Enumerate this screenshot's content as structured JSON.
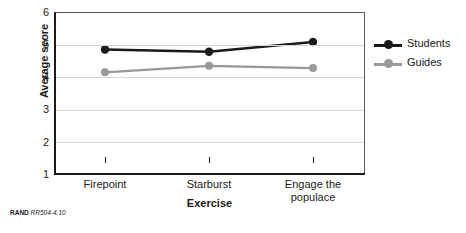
{
  "chart_data": {
    "type": "line",
    "title": "",
    "xlabel": "Exercise",
    "ylabel": "Average score",
    "categories": [
      "Firepoint",
      "Starburst",
      "Engage the populace"
    ],
    "category_lines": [
      [
        "Firepoint"
      ],
      [
        "Starburst"
      ],
      [
        "Engage the",
        "populace"
      ]
    ],
    "ylim": [
      1,
      6
    ],
    "yticks": [
      1,
      2,
      3,
      4,
      5,
      6
    ],
    "ytick_labels": [
      "1",
      "2",
      "3",
      "4",
      "5",
      "6"
    ],
    "grid": true,
    "legend_position": "right",
    "series": [
      {
        "name": "Students",
        "color": "#1a1a1a",
        "values": [
          4.85,
          4.78,
          5.08
        ]
      },
      {
        "name": "Guides",
        "color": "#999999",
        "values": [
          4.15,
          4.35,
          4.28
        ]
      }
    ]
  },
  "footer": {
    "brand": "RAND",
    "code": "RR504-4.10"
  }
}
